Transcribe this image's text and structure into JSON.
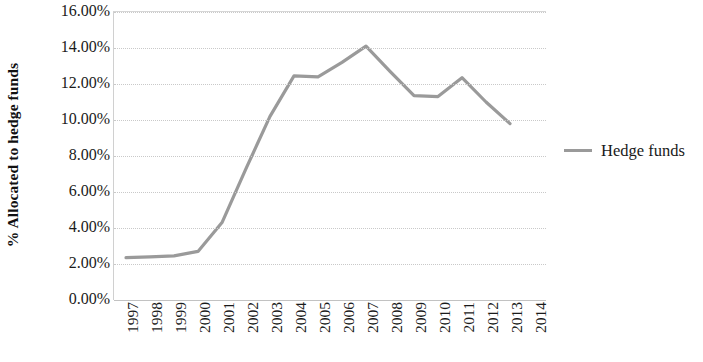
{
  "chart_data": {
    "type": "line",
    "title": "",
    "xlabel": "",
    "ylabel": "% Allocated to hedge funds",
    "ylim": [
      0,
      16
    ],
    "ytick_values": [
      16,
      14,
      12,
      10,
      8,
      6,
      4,
      2,
      0
    ],
    "ytick_labels": [
      "16.00%",
      "14.00%",
      "12.00%",
      "10.00%",
      "8.00%",
      "6.00%",
      "4.00%",
      "2.00%",
      "0.00%"
    ],
    "categories": [
      "1997",
      "1998",
      "1999",
      "2000",
      "2001",
      "2002",
      "2003",
      "2004",
      "2005",
      "2006",
      "2007",
      "2008",
      "2009",
      "2010",
      "2011",
      "2012",
      "2013",
      "2014"
    ],
    "series": [
      {
        "name": "Hedge funds",
        "color": "#9a9a9a",
        "values": [
          2.35,
          2.4,
          2.45,
          2.7,
          4.3,
          7.3,
          10.2,
          12.45,
          12.4,
          13.2,
          14.1,
          12.7,
          11.35,
          11.3,
          12.35,
          11.0,
          9.8,
          null
        ]
      }
    ],
    "legend": {
      "position": "right",
      "entries": [
        {
          "label": "Hedge funds",
          "color": "#9a9a9a"
        }
      ]
    },
    "grid": {
      "horizontal": true,
      "vertical": false,
      "style": "dotted",
      "color": "#c9c9c9"
    },
    "axis_color": "#c2c2c2",
    "background": "#ffffff"
  }
}
